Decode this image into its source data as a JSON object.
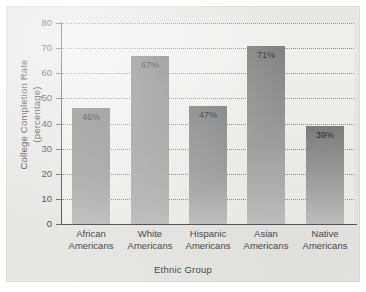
{
  "chart_data": {
    "type": "bar",
    "title": "",
    "xlabel": "Ethnic Group",
    "ylabel": "College Completion Rate (percentage)",
    "ylabel_lines": [
      "College Completion Rate",
      "(percentage)"
    ],
    "categories": [
      "African Americans",
      "White Americans",
      "Hispanic Americans",
      "Asian Americans",
      "Native Americans"
    ],
    "category_lines": [
      [
        "African",
        "Americans"
      ],
      [
        "White",
        "Americans"
      ],
      [
        "Hispanic",
        "Americans"
      ],
      [
        "Asian",
        "Americans"
      ],
      [
        "Native",
        "Americans"
      ]
    ],
    "values": [
      46,
      67,
      47,
      71,
      39
    ],
    "value_labels": [
      "46%",
      "67%",
      "47%",
      "71%",
      "39%"
    ],
    "ylim": [
      0,
      80
    ],
    "ytick_values": [
      0,
      10,
      20,
      30,
      40,
      50,
      60,
      70,
      80
    ],
    "ytick_labels": [
      "0",
      "10",
      "20",
      "30",
      "40",
      "50",
      "60",
      "70",
      "80"
    ],
    "grid": true,
    "grid_style": "dotted",
    "legend": "none",
    "colors": {
      "figure_background": "#e7e7e4",
      "plot_background": "#efefec",
      "bar_top": "#7d7d7d",
      "bar_bottom": "#c2c2c2",
      "axis_line": "#555555",
      "gridline": "#8d8d8d",
      "text": "#4a4a4a"
    }
  }
}
